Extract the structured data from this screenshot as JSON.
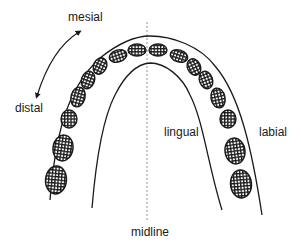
{
  "figure": {
    "labels": {
      "mesial": "mesial",
      "distal": "distal",
      "lingual": "lingual",
      "labial": "labial",
      "midline": "midline"
    },
    "colors": {
      "stroke": "#1a1a1a",
      "background": "#ffffff",
      "midline": "#777777"
    },
    "teeth_count_per_side": 8
  }
}
